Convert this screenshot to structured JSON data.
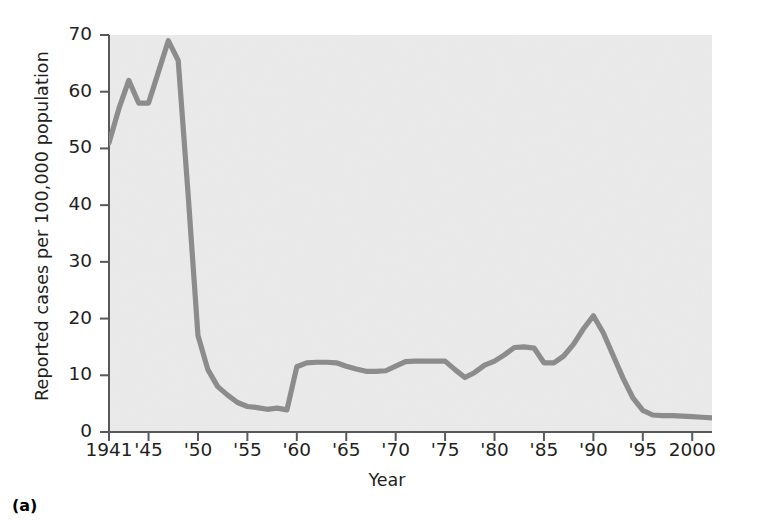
{
  "figure": {
    "caption": "(a)",
    "xlabel": "Year",
    "ylabel": "Reported cases per 100,000 population"
  },
  "colors": {
    "line": "#8c8c8c",
    "axis": "#58595b",
    "plot_background": "#ebebeb",
    "text": "#231f20",
    "page_background": "#ffffff"
  },
  "chart_data": {
    "type": "line",
    "title": "",
    "subtitle": "",
    "xlabel": "Year",
    "ylabel": "Reported cases per 100,000 population",
    "xlim": [
      1941,
      2002
    ],
    "ylim": [
      0,
      70
    ],
    "grid": false,
    "legend": null,
    "annotations": [],
    "x_tick_labels": [
      "1941",
      "'45",
      "'50",
      "'55",
      "'60",
      "'65",
      "'70",
      "'75",
      "'80",
      "'85",
      "'90",
      "'95",
      "2000"
    ],
    "x_tick_values": [
      1941,
      1945,
      1950,
      1955,
      1960,
      1965,
      1970,
      1975,
      1980,
      1985,
      1990,
      1995,
      2000
    ],
    "y_tick_labels": [
      "0",
      "10",
      "20",
      "30",
      "40",
      "50",
      "60",
      "70"
    ],
    "y_tick_values": [
      0,
      10,
      20,
      30,
      40,
      50,
      60,
      70
    ],
    "series": [
      {
        "name": "Reported cases per 100,000 population",
        "color": "#8c8c8c",
        "x": [
          1941,
          1942,
          1943,
          1944,
          1945,
          1946,
          1947,
          1948,
          1949,
          1950,
          1951,
          1952,
          1953,
          1954,
          1955,
          1956,
          1957,
          1958,
          1959,
          1960,
          1961,
          1962,
          1963,
          1964,
          1965,
          1966,
          1967,
          1968,
          1969,
          1970,
          1971,
          1972,
          1973,
          1974,
          1975,
          1976,
          1977,
          1978,
          1979,
          1980,
          1981,
          1982,
          1983,
          1984,
          1985,
          1986,
          1987,
          1988,
          1989,
          1990,
          1991,
          1992,
          1993,
          1994,
          1995,
          1996,
          1997,
          1998,
          1999,
          2000,
          2001,
          2002
        ],
        "y": [
          51,
          57,
          62,
          58,
          58,
          63.5,
          69,
          65.5,
          42,
          17,
          11,
          8,
          6.5,
          5.2,
          4.5,
          4.3,
          4.0,
          4.2,
          3.9,
          11.5,
          12.2,
          12.3,
          12.3,
          12.2,
          11.6,
          11.1,
          10.7,
          10.7,
          10.8,
          11.6,
          12.4,
          12.5,
          12.5,
          12.5,
          12.5,
          11.0,
          9.6,
          10.5,
          11.8,
          12.5,
          13.6,
          14.9,
          15.0,
          14.8,
          12.2,
          12.2,
          13.4,
          15.5,
          18.2,
          20.5,
          17.5,
          13.5,
          9.5,
          6.0,
          3.8,
          3.0,
          2.9,
          2.9,
          2.8,
          2.7,
          2.6,
          2.5
        ]
      }
    ]
  },
  "yticks": [
    {
      "value": 70,
      "label": "70"
    },
    {
      "value": 60,
      "label": "60"
    },
    {
      "value": 50,
      "label": "50"
    },
    {
      "value": 40,
      "label": "40"
    },
    {
      "value": 30,
      "label": "30"
    },
    {
      "value": 20,
      "label": "20"
    },
    {
      "value": 10,
      "label": "10"
    },
    {
      "value": 0,
      "label": "0"
    }
  ],
  "xticks": [
    {
      "value": 1941,
      "label": "1941"
    },
    {
      "value": 1945,
      "label": "'45"
    },
    {
      "value": 1950,
      "label": "'50"
    },
    {
      "value": 1955,
      "label": "'55"
    },
    {
      "value": 1960,
      "label": "'60"
    },
    {
      "value": 1965,
      "label": "'65"
    },
    {
      "value": 1970,
      "label": "'70"
    },
    {
      "value": 1975,
      "label": "'75"
    },
    {
      "value": 1980,
      "label": "'80"
    },
    {
      "value": 1985,
      "label": "'85"
    },
    {
      "value": 1990,
      "label": "'90"
    },
    {
      "value": 1995,
      "label": "'95"
    },
    {
      "value": 2000,
      "label": "2000"
    }
  ]
}
